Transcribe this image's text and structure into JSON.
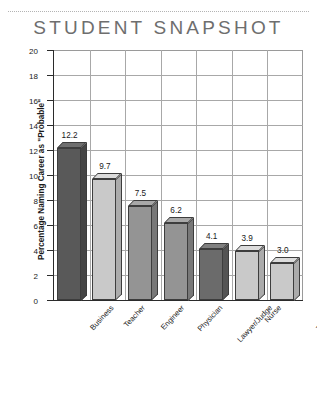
{
  "chart_data": {
    "type": "bar",
    "title": "STUDENT SNAPSHOT",
    "xlabel": "",
    "ylabel": "Percentage Naming Career as \"Probable\"",
    "ylim": [
      0,
      20
    ],
    "ytick_step": 2,
    "yticks": [
      "20",
      "18",
      "16",
      "14",
      "12",
      "10",
      "8",
      "6",
      "4",
      "2",
      "0"
    ],
    "grid": true,
    "legend": "none",
    "categories": [
      "Business",
      "Teacher",
      "Engineer",
      "Physician",
      "Lawyer/Judge",
      "Nurse",
      "Therapist (physical,\noccupational, speech)"
    ],
    "values": [
      12.2,
      9.7,
      7.5,
      6.2,
      4.1,
      3.9,
      3.0
    ],
    "value_labels": [
      "12.2",
      "9.7",
      "7.5",
      "6.2",
      "4.1",
      "3.9",
      "3.0"
    ],
    "bar_colors": [
      "#595959",
      "#c9c9c9",
      "#949494",
      "#949494",
      "#6b6b6b",
      "#c9c9c9",
      "#c9c9c9"
    ],
    "bar_top_colors": [
      "#6e6e6e",
      "#dcdcdc",
      "#a8a8a8",
      "#a8a8a8",
      "#808080",
      "#dcdcdc",
      "#dcdcdc"
    ],
    "bar_side_colors": [
      "#454545",
      "#ababab",
      "#787878",
      "#787878",
      "#545454",
      "#ababab",
      "#ababab"
    ]
  },
  "colors": {
    "title": "#6e6e6e",
    "axis": "#2b2b2b",
    "grid": "#a8a8a8",
    "background": "#ffffff"
  }
}
